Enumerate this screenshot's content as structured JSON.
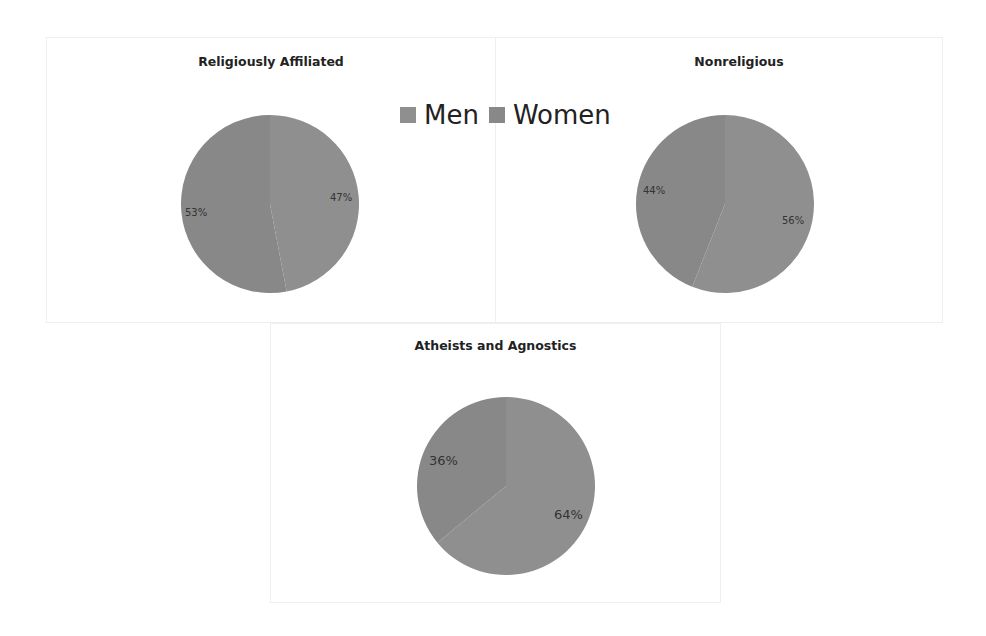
{
  "legend": {
    "items": [
      {
        "label": "Men",
        "color": "#8f8f8f"
      },
      {
        "label": "Women",
        "color": "#888888"
      }
    ]
  },
  "charts": [
    {
      "title": "Religiously Affiliated",
      "men_label": "47%",
      "women_label": "53%"
    },
    {
      "title": "Nonreligious",
      "men_label": "56%",
      "women_label": "44%"
    },
    {
      "title": "Atheists and Agnostics",
      "men_label": "64%",
      "women_label": "36%"
    }
  ],
  "chart_data": [
    {
      "type": "pie",
      "title": "Religiously Affiliated",
      "categories": [
        "Men",
        "Women"
      ],
      "values": [
        47,
        53
      ],
      "data_labels": [
        "47%",
        "53%"
      ],
      "legend_position": "top-center (shared)"
    },
    {
      "type": "pie",
      "title": "Nonreligious",
      "categories": [
        "Men",
        "Women"
      ],
      "values": [
        56,
        44
      ],
      "data_labels": [
        "56%",
        "44%"
      ],
      "legend_position": "top-center (shared)"
    },
    {
      "type": "pie",
      "title": "Atheists and Agnostics",
      "categories": [
        "Men",
        "Women"
      ],
      "values": [
        64,
        36
      ],
      "data_labels": [
        "64%",
        "36%"
      ],
      "legend_position": "top-center (shared)"
    }
  ]
}
